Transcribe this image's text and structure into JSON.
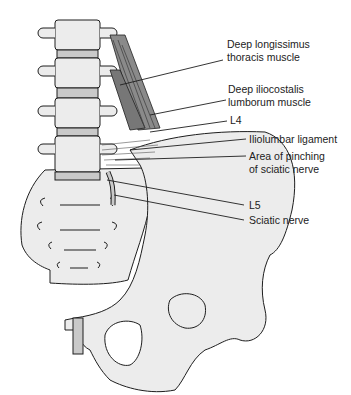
{
  "colors": {
    "bone_fill": "#ececec",
    "outline": "#1e1e1e",
    "disc_fill": "#c9c9c9",
    "muscle_fill": "#8a8a8a",
    "background": "#ffffff"
  },
  "labels": [
    {
      "id": "longissimus",
      "lines": [
        "Deep longissimus",
        "thoracis muscle"
      ]
    },
    {
      "id": "iliocostalis",
      "lines": [
        "Deep iliocostalis",
        "lumborum muscle"
      ]
    },
    {
      "id": "l4",
      "lines": [
        "L4"
      ]
    },
    {
      "id": "iliolumbar",
      "lines": [
        "Iliolumbar ligament"
      ]
    },
    {
      "id": "pinching",
      "lines": [
        "Area of pinching",
        "of sciatic nerve"
      ]
    },
    {
      "id": "l5",
      "lines": [
        "L5"
      ]
    },
    {
      "id": "sciatic",
      "lines": [
        "Sciatic nerve"
      ]
    }
  ]
}
